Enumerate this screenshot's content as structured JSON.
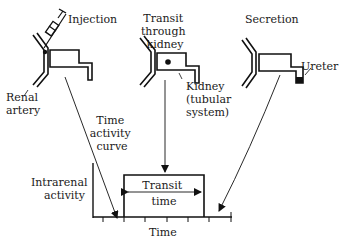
{
  "diagram": {
    "stages": [
      {
        "id": "injection",
        "title": "Injection"
      },
      {
        "id": "transit",
        "title_lines": [
          "Transit",
          "through",
          "kidney"
        ]
      },
      {
        "id": "secretion",
        "title": "Secretion"
      }
    ],
    "labels": {
      "renal_artery": [
        "Renal",
        "artery"
      ],
      "kidney": [
        "Kidney",
        "(tubular",
        "system)"
      ],
      "ureter": "Ureter",
      "time_activity_curve": [
        "Time",
        "activity",
        "curve"
      ]
    },
    "graph": {
      "ylabel": [
        "Intrarenal",
        "activity"
      ],
      "xlabel": "Time",
      "transit_label": [
        "Transit",
        "time"
      ]
    },
    "colors": {
      "ink": "#111111",
      "background": "#ffffff"
    }
  }
}
